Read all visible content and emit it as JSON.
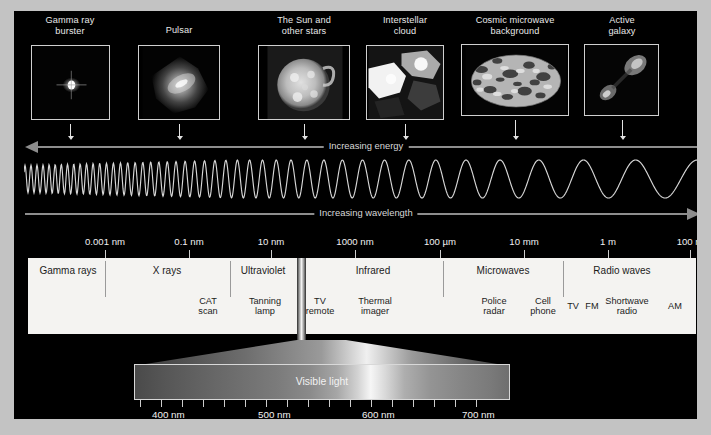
{
  "figure": {
    "title_hidden": "Electromagnetic spectrum",
    "background_color": "#000000",
    "mount_color": "#c3c3c3",
    "bar_color": "#f4f3f1"
  },
  "sources": [
    {
      "name": "gamma-ray-burster",
      "label_line1": "Gamma ray",
      "label_line2": "burster",
      "thumb": {
        "x": 31,
        "y": 45,
        "w": 79,
        "h": 75
      },
      "caption_cx": 70,
      "caption_y": 15,
      "arrow_x": 70
    },
    {
      "name": "pulsar",
      "label_line1": "Pulsar",
      "label_line2": "",
      "thumb": {
        "x": 138,
        "y": 45,
        "w": 82,
        "h": 75
      },
      "caption_cx": 179,
      "caption_y": 25,
      "arrow_x": 179
    },
    {
      "name": "the-sun-and-other-stars",
      "label_line1": "The Sun and",
      "label_line2": "other stars",
      "thumb": {
        "x": 258,
        "y": 45,
        "w": 92,
        "h": 75
      },
      "caption_cx": 304,
      "caption_y": 15,
      "arrow_x": 304
    },
    {
      "name": "interstellar-cloud",
      "label_line1": "Interstellar",
      "label_line2": "cloud",
      "thumb": {
        "x": 366,
        "y": 45,
        "w": 78,
        "h": 75
      },
      "caption_cx": 405,
      "caption_y": 15,
      "arrow_x": 405
    },
    {
      "name": "cosmic-microwave-background",
      "label_line1": "Cosmic microwave",
      "label_line2": "background",
      "thumb": {
        "x": 461,
        "y": 44,
        "w": 108,
        "h": 72
      },
      "caption_cx": 515,
      "caption_y": 15,
      "arrow_x": 515
    },
    {
      "name": "active-galaxy",
      "label_line1": "Active",
      "label_line2": "galaxy",
      "thumb": {
        "x": 584,
        "y": 44,
        "w": 75,
        "h": 72
      },
      "caption_cx": 622,
      "caption_y": 15,
      "arrow_x": 622
    }
  ],
  "axes": {
    "energy": {
      "label": "Increasing energy",
      "direction": "left",
      "y": 146,
      "x1": 25,
      "x2": 700,
      "label_cx": 366
    },
    "wavelength": {
      "label": "Increasing wavelength",
      "direction": "right",
      "y": 213,
      "x1": 25,
      "x2": 700,
      "label_cx": 366
    }
  },
  "wave": {
    "color": "#d7d7d7",
    "description": "sinusoid with wavelength increasing left to right"
  },
  "scale": {
    "ticks": [
      {
        "label": "0.001 nm",
        "x": 105
      },
      {
        "label": "0.1 nm",
        "x": 189
      },
      {
        "label": "10 nm",
        "x": 271
      },
      {
        "label": "1000 nm",
        "x": 355
      },
      {
        "label": "100 µm",
        "x": 440
      },
      {
        "label": "10 mm",
        "x": 524
      },
      {
        "label": "1 m",
        "x": 608
      },
      {
        "label": "100 m",
        "x": 690
      }
    ]
  },
  "bands": [
    {
      "name": "gamma-rays",
      "label": "Gamma rays",
      "cx": 68
    },
    {
      "name": "x-rays",
      "label": "X rays",
      "cx": 167
    },
    {
      "name": "ultraviolet",
      "label": "Ultraviolet",
      "cx": 263
    },
    {
      "name": "infrared",
      "label": "Infrared",
      "cx": 373
    },
    {
      "name": "microwaves",
      "label": "Microwaves",
      "cx": 503
    },
    {
      "name": "radio-waves",
      "label": "Radio waves",
      "cx": 622
    }
  ],
  "band_dividers": [
    105,
    230,
    443,
    563
  ],
  "applications": [
    {
      "name": "cat-scan",
      "line1": "CAT",
      "line2": "scan",
      "cx": 208
    },
    {
      "name": "tanning-lamp",
      "line1": "Tanning",
      "line2": "lamp",
      "cx": 265
    },
    {
      "name": "tv-remote",
      "line1": "TV",
      "line2": "remote",
      "cx": 320
    },
    {
      "name": "thermal-imager",
      "line1": "Thermal",
      "line2": "imager",
      "cx": 375
    },
    {
      "name": "police-radar",
      "line1": "Police",
      "line2": "radar",
      "cx": 494
    },
    {
      "name": "cell-phone",
      "line1": "Cell",
      "line2": "phone",
      "cx": 543
    },
    {
      "name": "tv",
      "line1": "TV",
      "line2": "",
      "cx": 573
    },
    {
      "name": "fm",
      "line1": "FM",
      "line2": "",
      "cx": 592
    },
    {
      "name": "shortwave-radio",
      "line1": "Shortwave",
      "line2": "radio",
      "cx": 627
    },
    {
      "name": "am",
      "line1": "AM",
      "line2": "",
      "cx": 675
    }
  ],
  "visible_light": {
    "label": "Visible light",
    "label_cx": 322,
    "strip": {
      "x": 134,
      "y": 364,
      "w": 376,
      "h": 36
    },
    "tick_labels": [
      {
        "label": "400 nm",
        "x": 152
      },
      {
        "label": "500 nm",
        "x": 258
      },
      {
        "label": "600 nm",
        "x": 362
      },
      {
        "label": "700 nm",
        "x": 462
      }
    ],
    "minor_tick_count": 17,
    "tick_start_x": 140,
    "tick_spacing": 21
  }
}
